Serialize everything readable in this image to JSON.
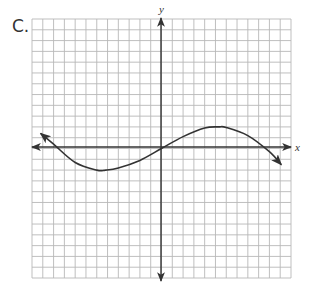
{
  "problem_label": "C.",
  "chart_data": {
    "type": "line",
    "title": "",
    "xlabel": "x",
    "ylabel": "y",
    "grid": true,
    "grid_cells": 24,
    "xlim": [
      -12,
      12
    ],
    "ylim": [
      -12,
      12
    ],
    "axes_arrows": true,
    "curve_arrows": true,
    "series": [
      {
        "name": "curve",
        "x": [
          -11.2,
          -10,
          -8,
          -6,
          -5.2,
          -4,
          -2,
          0,
          2,
          4,
          5.3,
          6,
          8,
          10,
          11.1
        ],
        "y": [
          1.4,
          0.4,
          -1.3,
          -2.0,
          -2.0,
          -1.8,
          -1.1,
          0,
          1.1,
          1.9,
          2.0,
          1.95,
          1.2,
          -0.3,
          -1.5
        ]
      }
    ],
    "key_points": {
      "local_min": [
        -5.2,
        -2
      ],
      "origin": [
        0,
        0
      ],
      "local_max": [
        5.3,
        2
      ]
    }
  },
  "colors": {
    "grid": "#b8b8b8",
    "axis": "#333333",
    "curve": "#333333",
    "text": "#333333"
  }
}
